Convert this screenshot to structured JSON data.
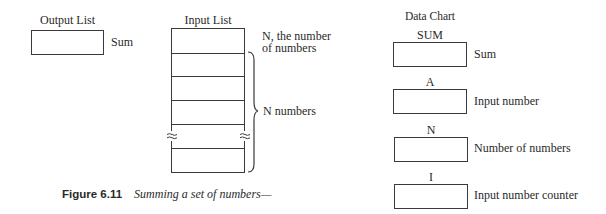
{
  "output_list": {
    "title": "Output List",
    "items": [
      {
        "label": "Sum"
      }
    ]
  },
  "input_list": {
    "title": "Input List",
    "first_cell_label": "N, the number",
    "first_cell_label_line2": "of numbers",
    "brace_label": "N numbers",
    "cell_count": 6,
    "break_marks": "≈"
  },
  "data_chart": {
    "title": "Data Chart",
    "variables": [
      {
        "name": "SUM",
        "description": "Sum"
      },
      {
        "name": "A",
        "description": "Input number"
      },
      {
        "name": "N",
        "description": "Number of numbers"
      },
      {
        "name": "I",
        "description": "Input number counter"
      }
    ]
  },
  "caption": {
    "figure_number": "Figure 6.11",
    "text": "Summing a set of numbers—"
  }
}
